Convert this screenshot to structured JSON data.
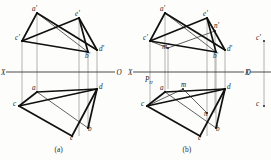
{
  "figure": {
    "background_color": "#fdfdfc",
    "ink_color": "#111111",
    "projection_line_color": "#9a9a9a",
    "axis_color": "#2b2b2b"
  },
  "panels": [
    {
      "id": "a",
      "caption": "(a)",
      "axis": {
        "left_label": "X",
        "right_label": "O",
        "y": 72,
        "x_start": 6,
        "x_end": 115
      },
      "vertical_projection_points": [
        {
          "name": "a-prime",
          "label": "a'",
          "x": 37,
          "y": 13,
          "label_x": 32,
          "label_y": 11
        },
        {
          "name": "e-prime",
          "label": "e'",
          "x": 79,
          "y": 18,
          "label_x": 75,
          "label_y": 16
        },
        {
          "name": "c-prime",
          "label": "c'",
          "x": 22,
          "y": 41,
          "label_x": 15,
          "label_y": 40
        },
        {
          "name": "b-prime",
          "label": "b'",
          "x": 88,
          "y": 52,
          "label_x": 85,
          "label_y": 58
        },
        {
          "name": "d-prime",
          "label": "d'",
          "x": 97,
          "y": 50,
          "label_x": 99,
          "label_y": 51
        }
      ],
      "horizontal_projection_points": [
        {
          "name": "a",
          "label": "a",
          "x": 37,
          "y": 92,
          "label_x": 32,
          "label_y": 90
        },
        {
          "name": "d",
          "label": "d",
          "x": 97,
          "y": 89,
          "label_x": 99,
          "label_y": 89
        },
        {
          "name": "c",
          "label": "c",
          "x": 19,
          "y": 106,
          "label_x": 13,
          "label_y": 106
        },
        {
          "name": "b",
          "label": "b",
          "x": 88,
          "y": 128,
          "label_x": 88,
          "label_y": 131
        },
        {
          "name": "e",
          "label": "e",
          "x": 72,
          "y": 136,
          "label_x": 70,
          "label_y": 140
        }
      ],
      "thick_segments_top": [
        [
          "c-prime",
          "a-prime"
        ],
        [
          "a-prime",
          "d-prime"
        ],
        [
          "c-prime",
          "e-prime"
        ],
        [
          "e-prime",
          "d-prime"
        ],
        [
          "c-prime",
          "b-prime"
        ],
        [
          "e-prime",
          "b-prime"
        ]
      ],
      "thin_segments_top": [
        [
          "a-prime",
          "b-prime"
        ]
      ],
      "thick_segments_bottom": [
        [
          "c",
          "a"
        ],
        [
          "a",
          "d"
        ],
        [
          "c",
          "e"
        ],
        [
          "e",
          "d"
        ],
        [
          "d",
          "b"
        ],
        [
          "c",
          "d"
        ]
      ],
      "thin_segments_bottom": [
        [
          "a",
          "b"
        ]
      ]
    },
    {
      "id": "b",
      "caption": "(b)",
      "axis": {
        "left_label": "X",
        "right_label": "O",
        "y": 72,
        "x_start": 133,
        "x_end": 244
      },
      "trace_label": {
        "name": "trace-PH",
        "main": "P",
        "sub": "H",
        "x": 145,
        "y": 82
      },
      "vertical_projection_points": [
        {
          "name": "a-prime",
          "label": "a'",
          "x": 165,
          "y": 13,
          "label_x": 160,
          "label_y": 11
        },
        {
          "name": "e-prime",
          "label": "e'",
          "x": 207,
          "y": 18,
          "label_x": 203,
          "label_y": 16
        },
        {
          "name": "n-prime",
          "label": "n'",
          "x": 215,
          "y": 31,
          "label_x": 214,
          "label_y": 28
        },
        {
          "name": "c-prime",
          "label": "c'",
          "x": 150,
          "y": 41,
          "label_x": 143,
          "label_y": 40
        },
        {
          "name": "m-prime",
          "label": "m'",
          "x": 168,
          "y": 48,
          "label_x": 162,
          "label_y": 49
        },
        {
          "name": "b-prime",
          "label": "b'",
          "x": 216,
          "y": 52,
          "label_x": 213,
          "label_y": 58
        },
        {
          "name": "d-prime",
          "label": "d'",
          "x": 225,
          "y": 50,
          "label_x": 227,
          "label_y": 51
        }
      ],
      "horizontal_projection_points": [
        {
          "name": "a",
          "label": "a",
          "x": 165,
          "y": 92,
          "label_x": 160,
          "label_y": 90
        },
        {
          "name": "m",
          "label": "m",
          "x": 183,
          "y": 89,
          "label_x": 181,
          "label_y": 87
        },
        {
          "name": "d",
          "label": "d",
          "x": 225,
          "y": 89,
          "label_x": 227,
          "label_y": 89
        },
        {
          "name": "c",
          "label": "c",
          "x": 147,
          "y": 106,
          "label_x": 141,
          "label_y": 106
        },
        {
          "name": "n",
          "label": "n",
          "x": 207,
          "y": 113,
          "label_x": 204,
          "label_y": 116
        },
        {
          "name": "b",
          "label": "b",
          "x": 216,
          "y": 128,
          "label_x": 216,
          "label_y": 131
        },
        {
          "name": "e",
          "label": "e",
          "x": 200,
          "y": 136,
          "label_x": 198,
          "label_y": 140
        }
      ],
      "thick_segments_top": [
        [
          "c-prime",
          "a-prime"
        ],
        [
          "a-prime",
          "d-prime"
        ],
        [
          "c-prime",
          "e-prime"
        ],
        [
          "e-prime",
          "d-prime"
        ],
        [
          "c-prime",
          "b-prime"
        ],
        [
          "e-prime",
          "b-prime"
        ]
      ],
      "thin_segments_top": [
        [
          "a-prime",
          "b-prime"
        ],
        [
          "c-prime",
          "m-prime"
        ],
        [
          "m-prime",
          "n-prime"
        ],
        [
          "n-prime",
          "e-prime"
        ]
      ],
      "thick_segments_bottom": [
        [
          "c",
          "a"
        ],
        [
          "a",
          "d"
        ],
        [
          "c",
          "e"
        ],
        [
          "e",
          "d"
        ],
        [
          "d",
          "b"
        ],
        [
          "c",
          "d"
        ]
      ],
      "thin_segments_bottom": [
        [
          "a",
          "b"
        ],
        [
          "c",
          "m"
        ],
        [
          "m",
          "n"
        ]
      ]
    },
    {
      "id": "c-partial",
      "caption": "",
      "axis": {
        "left_label": "X",
        "right_label": "",
        "y": 72,
        "x_start": 250,
        "x_end": 271
      },
      "vertical_projection_points": [
        {
          "name": "c-prime",
          "label": "c'",
          "x": 264,
          "y": 41,
          "label_x": 256,
          "label_y": 40
        }
      ],
      "horizontal_projection_points": [
        {
          "name": "c",
          "label": "c",
          "x": 264,
          "y": 106,
          "label_x": 256,
          "label_y": 106
        }
      ],
      "thick_segments_top": [],
      "thin_segments_top": [],
      "thick_segments_bottom": [],
      "thin_segments_bottom": []
    }
  ]
}
